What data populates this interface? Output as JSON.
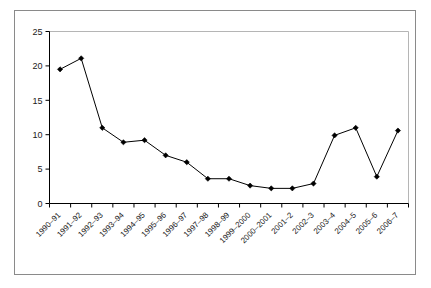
{
  "chart_data": {
    "type": "line",
    "title": "",
    "subtitle": "",
    "xlabel": "",
    "ylabel": "",
    "ylim": [
      0,
      25
    ],
    "ytick_values": [
      0,
      5,
      10,
      15,
      20,
      25
    ],
    "ytick_labels": [
      "0",
      "5",
      "10",
      "15",
      "20",
      "25"
    ],
    "grid": false,
    "legend": null,
    "marker": "diamond",
    "line_color": "#000000",
    "marker_color": "#000000",
    "categories": [
      "1990–91",
      "1991–92",
      "1992–93",
      "1993–94",
      "1994–95",
      "1995–96",
      "1996–97",
      "1997–98",
      "1998–99",
      "1999–2000",
      "2000–2001",
      "2001–2",
      "2002–3",
      "2003–4",
      "2004–5",
      "2005–6",
      "2006–7"
    ],
    "values": [
      19.5,
      21.1,
      11.0,
      8.9,
      9.2,
      7.0,
      6.0,
      3.6,
      3.6,
      2.6,
      2.2,
      2.2,
      2.9,
      9.9,
      11.0,
      3.9,
      10.6
    ]
  },
  "colors": {
    "outer_border": "#8a8a8a",
    "plot_border": "#b5b5b5",
    "axis": "#000000",
    "text": "#1a1a1a",
    "background": "#ffffff"
  }
}
